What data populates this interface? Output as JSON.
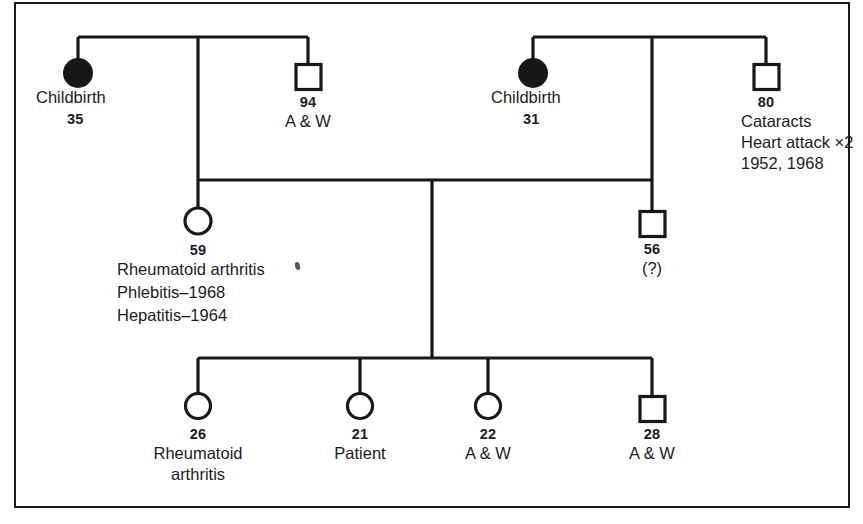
{
  "figure": {
    "type": "pedigree-chart",
    "border_color": "#17181a",
    "symbol_stroke_color": "#17181a",
    "background_color": "#ffffff"
  },
  "generations": [
    {
      "id": "generation-1",
      "members": [
        {
          "id": "g1-maternal-grandmother",
          "symbol": "circle-filled",
          "sex": "female",
          "status": "deceased",
          "age": "35",
          "lines": [
            "Childbirth"
          ]
        },
        {
          "id": "g1-maternal-grandfather",
          "symbol": "square-open",
          "sex": "male",
          "status": "living",
          "age": "94",
          "lines": [
            "A & W"
          ]
        },
        {
          "id": "g1-paternal-grandmother",
          "symbol": "circle-filled",
          "sex": "female",
          "status": "deceased",
          "age": "31",
          "lines": [
            "Childbirth"
          ]
        },
        {
          "id": "g1-paternal-grandfather",
          "symbol": "square-open",
          "sex": "male",
          "status": "living",
          "age": "80",
          "lines": [
            "Cataracts",
            "Heart attack ×2",
            "1952, 1968"
          ]
        }
      ]
    },
    {
      "id": "generation-2",
      "members": [
        {
          "id": "g2-mother",
          "symbol": "circle-open",
          "sex": "female",
          "status": "living",
          "age": "59",
          "lines": [
            "Rheumatoid arthritis",
            "Phlebitis–1968",
            "Hepatitis–1964"
          ]
        },
        {
          "id": "g2-father",
          "symbol": "square-open",
          "sex": "male",
          "status": "living",
          "age": "56",
          "lines": [
            "(?)"
          ]
        }
      ]
    },
    {
      "id": "generation-3",
      "members": [
        {
          "id": "g3-sibling-1",
          "symbol": "circle-open",
          "sex": "female",
          "status": "living",
          "age": "26",
          "lines": [
            "Rheumatoid",
            "arthritis"
          ]
        },
        {
          "id": "g3-proband",
          "symbol": "circle-open",
          "sex": "female",
          "status": "living",
          "age": "21",
          "lines": [
            "Patient"
          ]
        },
        {
          "id": "g3-sibling-3",
          "symbol": "circle-open",
          "sex": "female",
          "status": "living",
          "age": "22",
          "lines": [
            "A & W"
          ]
        },
        {
          "id": "g3-sibling-4",
          "symbol": "square-open",
          "sex": "male",
          "status": "living",
          "age": "28",
          "lines": [
            "A & W"
          ]
        }
      ]
    }
  ]
}
